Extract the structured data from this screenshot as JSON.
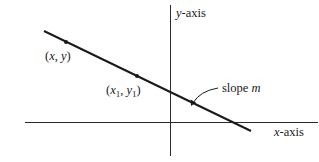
{
  "diagram": {
    "type": "point-slope line graph",
    "colors": {
      "line": "#1a1a1a",
      "axis": "#2a2a2a",
      "background": "#ffffff"
    },
    "axes": {
      "y_axis": {
        "label_var": "y",
        "label_rest": "-axis",
        "x": 170,
        "y_top": 5,
        "y_bottom": 156
      },
      "x_axis": {
        "label_var": "x",
        "label_rest": "-axis",
        "y": 122,
        "x_left": 25,
        "x_right": 318
      }
    },
    "line": {
      "x1": 44,
      "y1": 31,
      "x2": 251,
      "y2": 131
    },
    "points": [
      {
        "label_open": "(",
        "var_x": "x",
        "sep": ", ",
        "var_y": "y",
        "sub": "",
        "label_close": ")",
        "cx": 66,
        "cy": 42
      },
      {
        "label_open": "(",
        "var_x": "x",
        "sep": ", ",
        "var_y": "y",
        "sub": "1",
        "label_close": ")",
        "cx": 137,
        "cy": 76
      }
    ],
    "annotation": {
      "text_plain": "slope ",
      "text_var": "m"
    }
  }
}
